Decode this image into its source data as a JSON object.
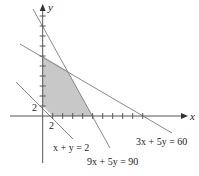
{
  "diagram": {
    "type": "linear-programming-feasible-region",
    "axes": {
      "x_label": "x",
      "y_label": "y",
      "tick_spacing_units": 2,
      "x_tick_label": "2",
      "y_tick_label": "2"
    },
    "constraints": [
      {
        "id": "line-x-plus-y-2",
        "equation": "x + y = 2",
        "a": 1,
        "b": 1,
        "c": 2
      },
      {
        "id": "line-9x-plus-5y-90",
        "equation": "9x + 5y = 90",
        "a": 9,
        "b": 5,
        "c": 90
      },
      {
        "id": "line-3x-plus-5y-60",
        "equation": "3x + 5y = 60",
        "a": 3,
        "b": 5,
        "c": 60
      }
    ],
    "feasible_region": {
      "vertices": [
        [
          0,
          2
        ],
        [
          0,
          12
        ],
        [
          5,
          9
        ],
        [
          10,
          0
        ],
        [
          2,
          0
        ]
      ],
      "fill": "#c8c8c8"
    },
    "colors": {
      "axis": "#555555",
      "line": "#8a8a8a",
      "region": "#c8c8c8",
      "text": "#222222"
    }
  }
}
